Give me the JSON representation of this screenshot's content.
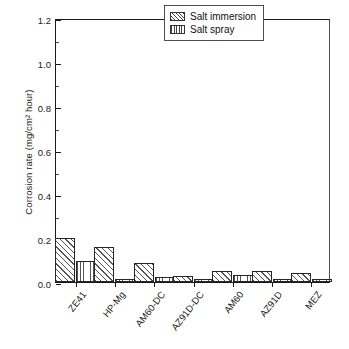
{
  "chart_data": {
    "type": "bar",
    "title": "",
    "xlabel": "",
    "ylabel": "Corrosion rate (mg/cm² hour)",
    "categories": [
      "ZE41",
      "HP-Mg",
      "AM60-DC",
      "AZ91D-DC",
      "AM60",
      "AZ91D",
      "MEZ"
    ],
    "series": [
      {
        "name": "Salt immersion",
        "values": [
          0.2,
          0.158,
          0.085,
          0.027,
          0.048,
          0.05,
          0.042
        ]
      },
      {
        "name": "Salt spray",
        "values": [
          0.095,
          0.013,
          0.025,
          0.015,
          0.03,
          0.014,
          0.014
        ]
      }
    ],
    "ylim": [
      0.0,
      1.2
    ],
    "ytick_values": [
      0.0,
      0.2,
      0.4,
      0.6,
      0.8,
      1.0,
      1.2
    ],
    "ytick_labels": [
      "0.0",
      "0.2",
      "0.4",
      "0.6",
      "0.8",
      "1.0",
      "1.2"
    ],
    "yminor_tick_values": [
      0.1,
      0.3,
      0.5,
      0.7,
      0.9,
      1.1
    ],
    "grid": false,
    "legend_position": "top-right"
  },
  "legend": {
    "entries": [
      {
        "label": "Salt immersion",
        "pattern": "diagonal-hatch"
      },
      {
        "label": "Salt spray",
        "pattern": "vertical-hatch"
      }
    ]
  }
}
